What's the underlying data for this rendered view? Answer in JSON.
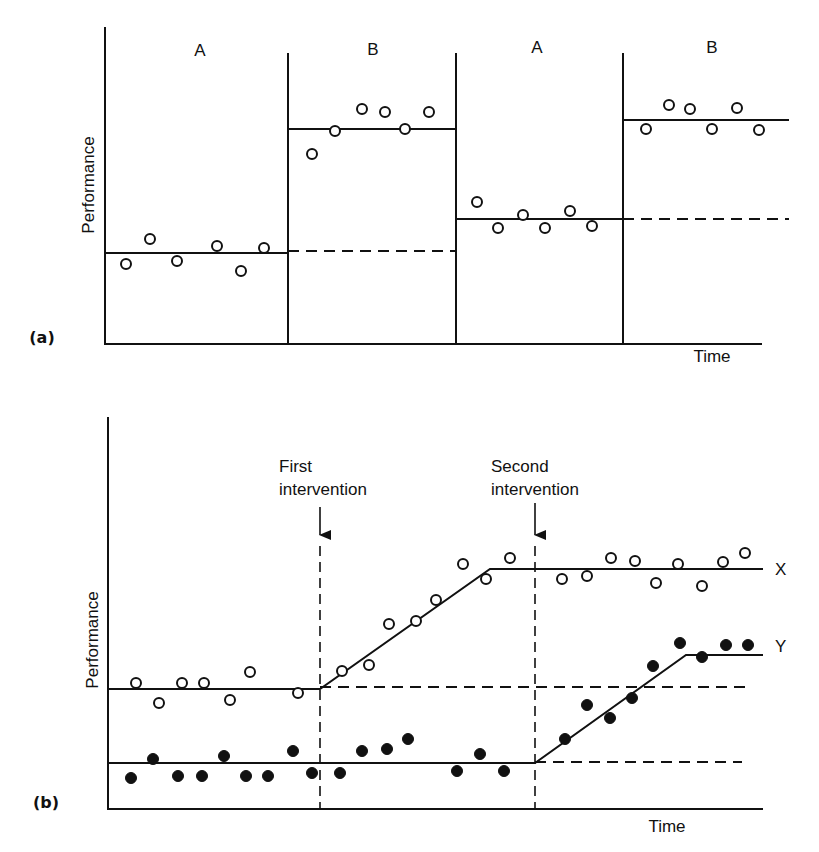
{
  "chart_data": [
    {
      "id": "a",
      "type": "scatter",
      "panel_label": "(a)",
      "title": "",
      "xlabel": "Time",
      "ylabel": "Performance",
      "phases": [
        "A",
        "B",
        "A",
        "B"
      ],
      "phase_boundaries_x": [
        288,
        456,
        623
      ],
      "grid": false,
      "series": [
        {
          "name": "Observations",
          "marker": "open-circle",
          "points": [
            {
              "phase": "A",
              "x": 126,
              "y": 264
            },
            {
              "phase": "A",
              "x": 150,
              "y": 239
            },
            {
              "phase": "A",
              "x": 177,
              "y": 261
            },
            {
              "phase": "A",
              "x": 217,
              "y": 246
            },
            {
              "phase": "A",
              "x": 241,
              "y": 271
            },
            {
              "phase": "A",
              "x": 264,
              "y": 248
            },
            {
              "phase": "B",
              "x": 312,
              "y": 154
            },
            {
              "phase": "B",
              "x": 335,
              "y": 131
            },
            {
              "phase": "B",
              "x": 362,
              "y": 109
            },
            {
              "phase": "B",
              "x": 385,
              "y": 112
            },
            {
              "phase": "B",
              "x": 405,
              "y": 129
            },
            {
              "phase": "B",
              "x": 429,
              "y": 112
            },
            {
              "phase": "A",
              "x": 477,
              "y": 202
            },
            {
              "phase": "A",
              "x": 498,
              "y": 228
            },
            {
              "phase": "A",
              "x": 523,
              "y": 215
            },
            {
              "phase": "A",
              "x": 545,
              "y": 228
            },
            {
              "phase": "A",
              "x": 570,
              "y": 211
            },
            {
              "phase": "A",
              "x": 592,
              "y": 226
            },
            {
              "phase": "B",
              "x": 646,
              "y": 129
            },
            {
              "phase": "B",
              "x": 669,
              "y": 105
            },
            {
              "phase": "B",
              "x": 690,
              "y": 109
            },
            {
              "phase": "B",
              "x": 712,
              "y": 129
            },
            {
              "phase": "B",
              "x": 737,
              "y": 108
            },
            {
              "phase": "B",
              "x": 759,
              "y": 130
            }
          ]
        }
      ],
      "phase_means": [
        {
          "phase": "A1",
          "x1": 105,
          "x2": 288,
          "y": 253,
          "style": "solid"
        },
        {
          "phase": "A1-projection",
          "x1": 288,
          "x2": 456,
          "y": 251,
          "style": "dashed"
        },
        {
          "phase": "B1",
          "x1": 288,
          "x2": 456,
          "y": 129,
          "style": "solid"
        },
        {
          "phase": "A2",
          "x1": 456,
          "x2": 623,
          "y": 219,
          "style": "solid"
        },
        {
          "phase": "A2-projection",
          "x1": 623,
          "x2": 789,
          "y": 219,
          "style": "dashed"
        },
        {
          "phase": "B2",
          "x1": 623,
          "x2": 789,
          "y": 120,
          "style": "solid"
        }
      ]
    },
    {
      "id": "b",
      "type": "scatter",
      "panel_label": "(b)",
      "title": "",
      "xlabel": "Time",
      "ylabel": "Performance",
      "grid": false,
      "annotations": [
        {
          "text_line1": "First",
          "text_line2": "intervention",
          "x": 320
        },
        {
          "text_line1": "Second",
          "text_line2": "intervention",
          "x": 535
        }
      ],
      "series": [
        {
          "name": "X",
          "marker": "open-circle",
          "points": [
            {
              "x": 136,
              "y": 683
            },
            {
              "x": 159,
              "y": 703
            },
            {
              "x": 182,
              "y": 683
            },
            {
              "x": 204,
              "y": 683
            },
            {
              "x": 230,
              "y": 700
            },
            {
              "x": 250,
              "y": 672
            },
            {
              "x": 298,
              "y": 693
            },
            {
              "x": 342,
              "y": 671
            },
            {
              "x": 369,
              "y": 665
            },
            {
              "x": 389,
              "y": 624
            },
            {
              "x": 416,
              "y": 621
            },
            {
              "x": 436,
              "y": 600
            },
            {
              "x": 463,
              "y": 564
            },
            {
              "x": 486,
              "y": 579
            },
            {
              "x": 510,
              "y": 558
            },
            {
              "x": 562,
              "y": 579
            },
            {
              "x": 587,
              "y": 576
            },
            {
              "x": 611,
              "y": 558
            },
            {
              "x": 635,
              "y": 561
            },
            {
              "x": 656,
              "y": 583
            },
            {
              "x": 678,
              "y": 564
            },
            {
              "x": 702,
              "y": 586
            },
            {
              "x": 723,
              "y": 562
            },
            {
              "x": 745,
              "y": 553
            }
          ],
          "trend": [
            [
              108,
              689
            ],
            [
              320,
              689
            ],
            [
              490,
              569
            ],
            [
              763,
              569
            ]
          ],
          "baseline_projection": {
            "x1": 320,
            "x2": 750,
            "y": 687
          }
        },
        {
          "name": "Y",
          "marker": "filled-circle",
          "points": [
            {
              "x": 131,
              "y": 778
            },
            {
              "x": 153,
              "y": 759
            },
            {
              "x": 178,
              "y": 776
            },
            {
              "x": 202,
              "y": 776
            },
            {
              "x": 224,
              "y": 756
            },
            {
              "x": 246,
              "y": 776
            },
            {
              "x": 268,
              "y": 776
            },
            {
              "x": 293,
              "y": 751
            },
            {
              "x": 312,
              "y": 773
            },
            {
              "x": 340,
              "y": 773
            },
            {
              "x": 362,
              "y": 751
            },
            {
              "x": 387,
              "y": 749
            },
            {
              "x": 408,
              "y": 739
            },
            {
              "x": 457,
              "y": 771
            },
            {
              "x": 480,
              "y": 754
            },
            {
              "x": 504,
              "y": 771
            },
            {
              "x": 565,
              "y": 739
            },
            {
              "x": 587,
              "y": 705
            },
            {
              "x": 610,
              "y": 718
            },
            {
              "x": 632,
              "y": 698
            },
            {
              "x": 653,
              "y": 666
            },
            {
              "x": 680,
              "y": 643
            },
            {
              "x": 702,
              "y": 657
            },
            {
              "x": 726,
              "y": 645
            },
            {
              "x": 748,
              "y": 645
            }
          ],
          "trend": [
            [
              108,
              763
            ],
            [
              535,
              763
            ],
            [
              686,
              655
            ],
            [
              763,
              655
            ]
          ],
          "baseline_projection": {
            "x1": 535,
            "x2": 742,
            "y": 762
          }
        }
      ],
      "series_labels": [
        {
          "text": "X",
          "x": 775,
          "y": 569
        },
        {
          "text": "Y",
          "x": 775,
          "y": 646
        }
      ]
    }
  ],
  "labels": {
    "a": {
      "panel": "(a)",
      "ylabel": "Performance",
      "xlabel": "Time",
      "phase1": "A",
      "phase2": "B",
      "phase3": "A",
      "phase4": "B"
    },
    "b": {
      "panel": "(b)",
      "ylabel": "Performance",
      "xlabel": "Time",
      "first_line1": "First",
      "first_line2": "intervention",
      "second_line1": "Second",
      "second_line2": "intervention",
      "series_x": "X",
      "series_y": "Y"
    }
  }
}
